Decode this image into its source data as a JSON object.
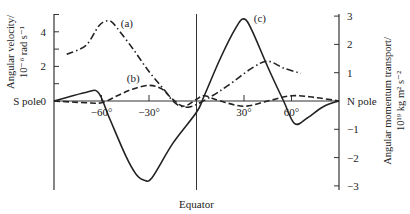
{
  "chart_data": {
    "type": "line",
    "title": "",
    "xlabel": "Equator",
    "x_left_label": "S pole",
    "x_right_label": "N pole",
    "xlim": [
      -90,
      90
    ],
    "x_ticks": [
      -60,
      -30,
      30,
      60
    ],
    "x_tick_labels": [
      "−60°",
      "−30°",
      "30°",
      "60°"
    ],
    "ylabel_left_line1": "Angular velocity/",
    "ylabel_left_line2": "10⁻⁶ rad s⁻¹",
    "ylim_left": [
      -5,
      5
    ],
    "y_left_tick_labels": [
      {
        "v": 4,
        "t": "4"
      },
      {
        "v": 2,
        "t": "2"
      },
      {
        "v": 0,
        "t": "0"
      }
    ],
    "ylabel_right_line1": "Angular momentum transport/",
    "ylabel_right_line2": "10¹⁹ kg m² s⁻²",
    "ylim_right": [
      -3,
      3
    ],
    "y_right_tick_labels": [
      {
        "v": 3,
        "t": "3"
      },
      {
        "v": 2,
        "t": "2"
      },
      {
        "v": 1,
        "t": "1"
      },
      {
        "v": -1,
        "t": "−1"
      },
      {
        "v": -2,
        "t": "−2"
      },
      {
        "v": -3,
        "t": "−3"
      }
    ],
    "series": [
      {
        "name": "(a)",
        "axis": "left",
        "style": "dash-dot",
        "label_pos": [
          -44,
          4.3
        ],
        "x": [
          -82,
          -70,
          -62,
          -58,
          -54,
          -50,
          -40,
          -30,
          -20,
          -15,
          -10,
          -5,
          0,
          10,
          20,
          35,
          45,
          55,
          66
        ],
        "values": [
          2.7,
          3.2,
          4.3,
          4.6,
          4.6,
          4.2,
          3.0,
          1.7,
          0.6,
          0.0,
          -0.3,
          -0.35,
          -0.2,
          0.3,
          0.9,
          1.9,
          2.3,
          1.9,
          1.6
        ]
      },
      {
        "name": "(b)",
        "axis": "left",
        "style": "dashed",
        "label_pos": [
          -40,
          1.1
        ],
        "x": [
          -90,
          -70,
          -60,
          -50,
          -40,
          -30,
          -22,
          -15,
          -8,
          0,
          5,
          15,
          30,
          45,
          60,
          75,
          90
        ],
        "values": [
          0,
          -0.1,
          -0.1,
          0.3,
          0.7,
          0.9,
          0.7,
          0.1,
          -0.3,
          0.1,
          0.3,
          0.0,
          -0.3,
          0.0,
          0.3,
          0.2,
          0
        ]
      },
      {
        "name": "(c)",
        "axis": "right",
        "style": "solid",
        "label_pos": [
          40,
          2.8
        ],
        "x": [
          -90,
          -70,
          -62,
          -55,
          -45,
          -38,
          -33,
          -28,
          -15,
          0,
          5,
          15,
          25,
          30,
          35,
          45,
          55,
          62,
          70,
          80,
          90
        ],
        "values": [
          0,
          0.3,
          0.3,
          -0.6,
          -1.9,
          -2.6,
          -2.8,
          -2.7,
          -1.5,
          -0.4,
          0.2,
          1.5,
          2.6,
          2.9,
          2.5,
          1.2,
          0.0,
          -0.8,
          -0.6,
          -0.2,
          0
        ]
      }
    ],
    "grid": false,
    "legend": "inline labels"
  }
}
